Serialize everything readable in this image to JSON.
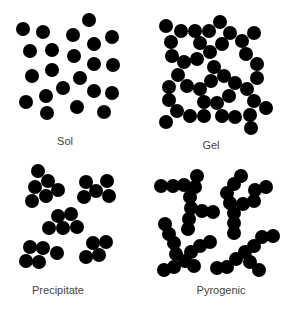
{
  "dot_color": "#000000",
  "label_color": "#444444",
  "dot_radius": 7,
  "panels": [
    {
      "name": "sol",
      "label": "Sol",
      "label_pos": [
        65,
        135
      ],
      "dots": [
        [
          23,
          29
        ],
        [
          43,
          32
        ],
        [
          89,
          20
        ],
        [
          73,
          35
        ],
        [
          112,
          37
        ],
        [
          30,
          51
        ],
        [
          52,
          50
        ],
        [
          94,
          44
        ],
        [
          74,
          56
        ],
        [
          94,
          64
        ],
        [
          113,
          65
        ],
        [
          32,
          76
        ],
        [
          52,
          70
        ],
        [
          80,
          78
        ],
        [
          63,
          88
        ],
        [
          94,
          91
        ],
        [
          112,
          93
        ],
        [
          26,
          102
        ],
        [
          46,
          96
        ],
        [
          47,
          113
        ],
        [
          77,
          107
        ],
        [
          104,
          112
        ]
      ]
    },
    {
      "name": "gel",
      "label": "Gel",
      "label_pos": [
        211,
        139
      ],
      "dots": [
        [
          166,
          26
        ],
        [
          181,
          31
        ],
        [
          195,
          31
        ],
        [
          209,
          31
        ],
        [
          220,
          22
        ],
        [
          230,
          33
        ],
        [
          254,
          33
        ],
        [
          171,
          42
        ],
        [
          200,
          43
        ],
        [
          222,
          44
        ],
        [
          242,
          41
        ],
        [
          172,
          56
        ],
        [
          184,
          62
        ],
        [
          197,
          59
        ],
        [
          210,
          52
        ],
        [
          246,
          54
        ],
        [
          257,
          64
        ],
        [
          178,
          75
        ],
        [
          214,
          67
        ],
        [
          224,
          76
        ],
        [
          211,
          81
        ],
        [
          257,
          78
        ],
        [
          169,
          87
        ],
        [
          187,
          86
        ],
        [
          200,
          89
        ],
        [
          235,
          83
        ],
        [
          247,
          89
        ],
        [
          169,
          100
        ],
        [
          229,
          96
        ],
        [
          204,
          102
        ],
        [
          217,
          103
        ],
        [
          254,
          101
        ],
        [
          266,
          108
        ],
        [
          177,
          111
        ],
        [
          190,
          116
        ],
        [
          204,
          116
        ],
        [
          222,
          116
        ],
        [
          235,
          117
        ],
        [
          250,
          115
        ],
        [
          166,
          122
        ],
        [
          251,
          128
        ]
      ]
    },
    {
      "name": "precipitate",
      "label": "Precipitate",
      "label_pos": [
        58,
        284
      ],
      "dots": [
        [
          38,
          171
        ],
        [
          48,
          181
        ],
        [
          35,
          187
        ],
        [
          58,
          190
        ],
        [
          46,
          196
        ],
        [
          32,
          201
        ],
        [
          86,
          182
        ],
        [
          107,
          181
        ],
        [
          96,
          191
        ],
        [
          84,
          197
        ],
        [
          109,
          196
        ],
        [
          58,
          216
        ],
        [
          71,
          214
        ],
        [
          49,
          228
        ],
        [
          63,
          228
        ],
        [
          77,
          227
        ],
        [
          30,
          247
        ],
        [
          43,
          248
        ],
        [
          57,
          253
        ],
        [
          26,
          261
        ],
        [
          39,
          262
        ],
        [
          93,
          243
        ],
        [
          106,
          242
        ],
        [
          86,
          257
        ],
        [
          99,
          255
        ]
      ]
    },
    {
      "name": "pyrogenic",
      "label": "Pyrogenic",
      "label_pos": [
        221,
        284
      ],
      "dots": [
        [
          197,
          176
        ],
        [
          161,
          186
        ],
        [
          173,
          186
        ],
        [
          184,
          185
        ],
        [
          195,
          187
        ],
        [
          190,
          197
        ],
        [
          191,
          208
        ],
        [
          202,
          211
        ],
        [
          213,
          212
        ],
        [
          189,
          219
        ],
        [
          188,
          229
        ],
        [
          165,
          224
        ],
        [
          169,
          234
        ],
        [
          174,
          243
        ],
        [
          176,
          254
        ],
        [
          185,
          261
        ],
        [
          194,
          266
        ],
        [
          164,
          270
        ],
        [
          174,
          267
        ],
        [
          191,
          252
        ],
        [
          200,
          246
        ],
        [
          210,
          242
        ],
        [
          241,
          176
        ],
        [
          234,
          184
        ],
        [
          227,
          193
        ],
        [
          230,
          203
        ],
        [
          243,
          204
        ],
        [
          254,
          201
        ],
        [
          255,
          190
        ],
        [
          266,
          187
        ],
        [
          234,
          213
        ],
        [
          234,
          223
        ],
        [
          234,
          233
        ],
        [
          273,
          236
        ],
        [
          262,
          237
        ],
        [
          254,
          246
        ],
        [
          245,
          252
        ],
        [
          236,
          259
        ],
        [
          227,
          267
        ],
        [
          217,
          268
        ],
        [
          250,
          262
        ],
        [
          259,
          270
        ]
      ]
    }
  ]
}
